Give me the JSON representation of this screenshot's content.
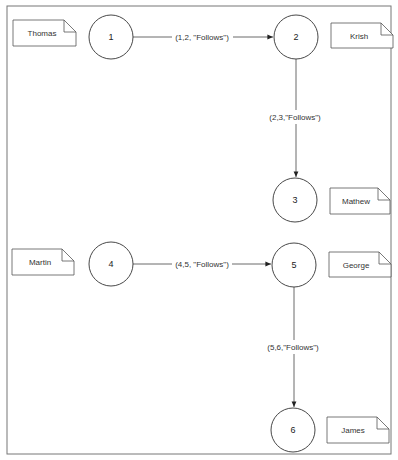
{
  "diagram": {
    "type": "graph",
    "nodes": [
      {
        "id": "1",
        "label": "1",
        "note": "Thomas",
        "cx": 111,
        "cy": 37
      },
      {
        "id": "2",
        "label": "2",
        "note": "Krish",
        "cx": 296,
        "cy": 37
      },
      {
        "id": "3",
        "label": "3",
        "note": "Mathew",
        "cx": 295,
        "cy": 200
      },
      {
        "id": "4",
        "label": "4",
        "note": "Martin",
        "cx": 111,
        "cy": 264
      },
      {
        "id": "5",
        "label": "5",
        "note": "George",
        "cx": 294,
        "cy": 265
      },
      {
        "id": "6",
        "label": "6",
        "note": "James",
        "cx": 293,
        "cy": 430
      }
    ],
    "edges": [
      {
        "from": "1",
        "to": "2",
        "label": "(1,2, \"Follows\")"
      },
      {
        "from": "2",
        "to": "3",
        "label": "(2,3,\"Follows\")"
      },
      {
        "from": "4",
        "to": "5",
        "label": "(4,5, \"Follows\")"
      },
      {
        "from": "5",
        "to": "6",
        "label": "(5,6,\"Follows\")"
      }
    ]
  }
}
